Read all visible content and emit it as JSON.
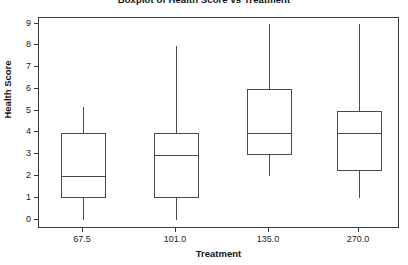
{
  "chart_data": {
    "type": "box",
    "title": "Boxplot of Health Score vs Treatment",
    "xlabel": "Treatment",
    "ylabel": "Health Score",
    "categories": [
      "67.5",
      "101.0",
      "135.0",
      "270.0"
    ],
    "ylim": [
      0,
      9
    ],
    "yticks": [
      0,
      1,
      2,
      3,
      4,
      5,
      6,
      7,
      8,
      9
    ],
    "ytick_labels": [
      "0",
      "1",
      "2",
      "3",
      "4",
      "5",
      "6",
      "7",
      "8",
      "9"
    ],
    "grid": false,
    "legend": "none",
    "boxes": [
      {
        "category": "67.5",
        "whisker_low": 0.0,
        "q1": 1.0,
        "median": 2.0,
        "q3": 4.0,
        "whisker_high": 5.2
      },
      {
        "category": "101.0",
        "whisker_low": 0.0,
        "q1": 1.0,
        "median": 3.0,
        "q3": 4.0,
        "whisker_high": 8.0
      },
      {
        "category": "135.0",
        "whisker_low": 2.0,
        "q1": 3.0,
        "median": 4.0,
        "q3": 6.0,
        "whisker_high": 9.0
      },
      {
        "category": "270.0",
        "whisker_low": 1.0,
        "q1": 2.25,
        "median": 4.0,
        "q3": 5.0,
        "whisker_high": 9.0
      }
    ]
  },
  "style": {
    "line_color": "#4a4a4a",
    "axis_color": "#3a3a3a",
    "background": "#ffffff",
    "text_color": "#111111"
  }
}
